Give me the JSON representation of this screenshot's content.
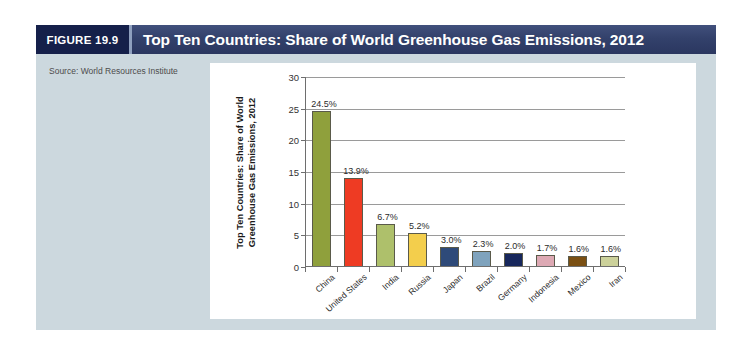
{
  "figure": {
    "badge": "FIGURE 19.9",
    "title": "Top Ten Countries: Share of World Greenhouse Gas Emissions, 2012",
    "source": "Source: World Resources Institute",
    "header_bg": "#33416b",
    "badge_bg": "#15204a",
    "body_bg": "#ccd8de",
    "panel_bg": "#ffffff"
  },
  "chart_data": {
    "type": "bar",
    "title": "",
    "xlabel": "",
    "ylabel": "Top Ten Countries: Share of World Greenhouse Gas Emissions, 2012",
    "ylabel_lines": [
      "Top Ten Countries: Share of World",
      "Greenhouse Gas Emissions, 2012"
    ],
    "ylim": [
      0,
      30
    ],
    "yticks": [
      0,
      5,
      10,
      15,
      20,
      25,
      30
    ],
    "ytick_labels": [
      "0",
      "5",
      "10",
      "15",
      "20",
      "25",
      "30"
    ],
    "grid": true,
    "legend": "none",
    "categories": [
      "China",
      "United States",
      "India",
      "Russia",
      "Japan",
      "Brazil",
      "Germany",
      "Indonesia",
      "Mexico",
      "Iran"
    ],
    "values": [
      24.5,
      13.9,
      6.7,
      5.2,
      3.0,
      2.3,
      2.0,
      1.7,
      1.6,
      1.6
    ],
    "data_labels": [
      "24.5%",
      "13.9%",
      "6.7%",
      "5.2%",
      "3.0%",
      "2.3%",
      "2.0%",
      "1.7%",
      "1.6%",
      "1.6%"
    ],
    "colors": [
      "#8fa03c",
      "#ee3b23",
      "#aec06b",
      "#f3ce4c",
      "#2e4a79",
      "#7fa3bd",
      "#17275c",
      "#dda9b4",
      "#7a4f13",
      "#ccd19a"
    ]
  }
}
